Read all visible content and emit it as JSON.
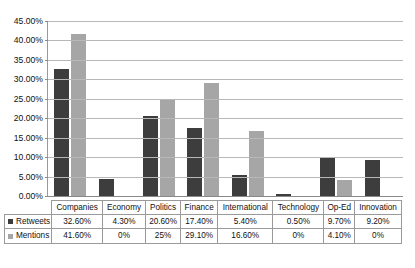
{
  "chart_data": {
    "type": "bar",
    "title": "",
    "subtitle": "",
    "xlabel": "",
    "ylabel": "",
    "ylim": [
      0,
      45
    ],
    "ytick_step": 5,
    "grid": true,
    "legend_position": "table-below",
    "categories": [
      "Companies",
      "Economy",
      "Politics",
      "Finance",
      "International",
      "Technology",
      "Op-Ed",
      "Innovation"
    ],
    "series": [
      {
        "name": "Retweets",
        "color": "#3d3d3d",
        "values": [
          32.6,
          4.3,
          20.6,
          17.4,
          5.4,
          0.5,
          9.7,
          9.2
        ],
        "labels": [
          "32.60%",
          "4.30%",
          "20.60%",
          "17.40%",
          "5.40%",
          "0.50%",
          "9.70%",
          "9.20%"
        ]
      },
      {
        "name": "Mentions",
        "color": "#a6a6a6",
        "values": [
          41.6,
          0,
          25.0,
          29.1,
          16.6,
          0,
          4.1,
          0
        ],
        "labels": [
          "41.60%",
          "0%",
          "25%",
          "29.10%",
          "16.60%",
          "0%",
          "4.10%",
          "0%"
        ]
      }
    ],
    "ytick_labels": [
      "45.00%",
      "40.00%",
      "35.00%",
      "30.00%",
      "25.00%",
      "20.00%",
      "15.00%",
      "10.00%",
      "5.00%",
      "0.00%"
    ],
    "ytick_values": [
      45,
      40,
      35,
      30,
      25,
      20,
      15,
      10,
      5,
      0
    ]
  }
}
